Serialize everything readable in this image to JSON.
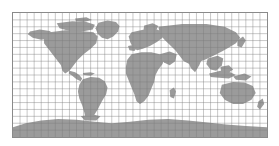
{
  "figure": {
    "kind": "world-map",
    "projection": "equirectangular",
    "title": "",
    "background_color": "#ffffff",
    "frame_color": "#8a8a8a",
    "ocean_color": "#ffffff",
    "land_color": "#9b9b9b",
    "graticule_color": "#7d7d7d",
    "frame": {
      "x": 12,
      "y": 12,
      "width": 256,
      "height": 126
    }
  },
  "chart_data": {
    "type": "map",
    "xlabel": "Longitude",
    "ylabel": "Latitude",
    "xlim": [
      -180,
      180
    ],
    "ylim": [
      -90,
      90
    ],
    "grid": true,
    "grid_spacing_deg": {
      "longitude": 10,
      "latitude": 10
    },
    "longitude_ticks": [
      -180,
      -170,
      -160,
      -150,
      -140,
      -130,
      -120,
      -110,
      -100,
      -90,
      -80,
      -70,
      -60,
      -50,
      -40,
      -30,
      -20,
      -10,
      0,
      10,
      20,
      30,
      40,
      50,
      60,
      70,
      80,
      90,
      100,
      110,
      120,
      130,
      140,
      150,
      160,
      170,
      180
    ],
    "latitude_ticks": [
      -90,
      -80,
      -70,
      -60,
      -50,
      -40,
      -30,
      -20,
      -10,
      0,
      10,
      20,
      30,
      40,
      50,
      60,
      70,
      80,
      90
    ],
    "grid_columns": 36,
    "grid_rows": 18,
    "legend": [],
    "annotations": [],
    "regions": [
      {
        "name": "North America",
        "visible": true
      },
      {
        "name": "Greenland",
        "visible": true
      },
      {
        "name": "South America",
        "visible": true
      },
      {
        "name": "Africa",
        "visible": true
      },
      {
        "name": "Europe",
        "visible": true
      },
      {
        "name": "Asia",
        "visible": true
      },
      {
        "name": "Australia",
        "visible": true
      },
      {
        "name": "Antarctica",
        "visible": true
      }
    ]
  },
  "labels": {
    "figure_caption": "",
    "map_alt": "Grayscale world map"
  }
}
